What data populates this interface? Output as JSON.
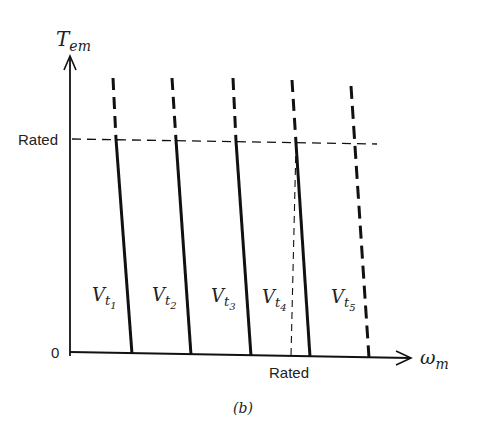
{
  "figure": {
    "caption": "(b)",
    "y_axis": {
      "symbol": "T",
      "subscript": "em",
      "tick_label": "Rated",
      "origin_label": "0"
    },
    "x_axis": {
      "symbol": "ω",
      "subscript": "m",
      "tick_label": "Rated"
    },
    "curves": [
      {
        "name": "V",
        "sub1": "t",
        "sub2": "1",
        "style": "solid-below-rated"
      },
      {
        "name": "V",
        "sub1": "t",
        "sub2": "2",
        "style": "solid-below-rated"
      },
      {
        "name": "V",
        "sub1": "t",
        "sub2": "3",
        "style": "solid-below-rated"
      },
      {
        "name": "V",
        "sub1": "t",
        "sub2": "4",
        "style": "solid-below-rated"
      },
      {
        "name": "V",
        "sub1": "t",
        "sub2": "5",
        "style": "dashed"
      }
    ],
    "colors": {
      "ink": "#111111",
      "background": "#ffffff"
    }
  }
}
